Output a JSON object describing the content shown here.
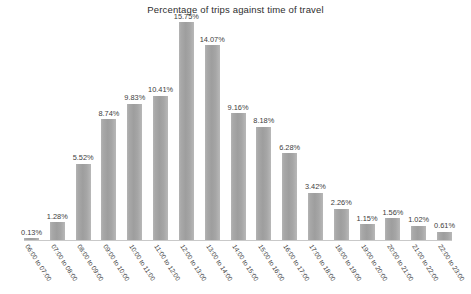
{
  "chart_data": {
    "type": "bar",
    "title": "Percentage of trips against time of travel",
    "xlabel": "",
    "ylabel": "",
    "ylim": [
      0,
      15.75
    ],
    "grid": false,
    "legend": null,
    "value_suffix": "%",
    "bar_color": "#a8a8a8",
    "background_color": "#ffffff",
    "categories": [
      "06:00 to 07:00",
      "07:00 to 08:00",
      "08:00 to 09:00",
      "09:00 to 10:00",
      "10:00 to 11:00",
      "11:00 to 12:00",
      "12:00 to 13:00",
      "13:00 to 14:00",
      "14:00 to 15:00",
      "15:00 to 16:00",
      "16:00 to 17:00",
      "17:00 to 18:00",
      "18:00 to 19:00",
      "19:00 to 20:00",
      "20:00 to 21:00",
      "21:00 to 22:00",
      "22:00 to 23:00"
    ],
    "values": [
      0.13,
      1.28,
      5.52,
      8.74,
      9.83,
      10.41,
      15.75,
      14.07,
      9.16,
      8.18,
      6.28,
      3.42,
      2.26,
      1.15,
      1.56,
      1.02,
      0.61
    ],
    "data_labels": [
      "0.13%",
      "1.28%",
      "5.52%",
      "8.74%",
      "9.83%",
      "10.41%",
      "15.75%",
      "14.07%",
      "9.16%",
      "8.18%",
      "6.28%",
      "3.42%",
      "2.26%",
      "1.15%",
      "1.56%",
      "1.02%",
      "0.61%"
    ]
  }
}
